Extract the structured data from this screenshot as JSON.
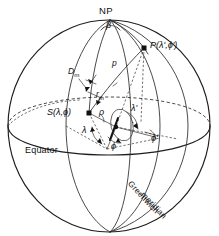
{
  "figure": {
    "kind": "spherical-geometry-diagram",
    "caption_text": "",
    "background_color": "#ffffff",
    "ink_color": "#111111"
  },
  "labels": {
    "north_pole": "NP",
    "point_p": "P(λ',ϕ')",
    "point_s": "S(λ,ϕ)",
    "equator": "Equator",
    "greenwich_line1": "Greenwich",
    "greenwich_line2": "meridian",
    "arc_p": "p",
    "angle_beta": "β",
    "distance_dm": "D",
    "distance_dm_sub": "m",
    "radius_rm": "r",
    "radius_rm_sub": "m",
    "small_rho": "ρ",
    "lambda": "λ",
    "lambda_prime": "λ'",
    "phi": "ϕ",
    "phi_prime": "ϕ'"
  },
  "geometry": {
    "sphere_center_x": 109,
    "sphere_center_y": 126,
    "sphere_radius_x": 101,
    "sphere_radius_y": 106,
    "north_pole_x": 110,
    "north_pole_y": 20,
    "south_pole_x": 110,
    "south_pole_y": 232,
    "point_s_x": 89,
    "point_s_y": 113,
    "point_p_x": 144,
    "point_p_y": 48,
    "equator_ry": 26
  },
  "colors": {
    "ink": "#111111",
    "line": "#1d1d1d",
    "hidden": "#333333",
    "paper": "#ffffff"
  }
}
